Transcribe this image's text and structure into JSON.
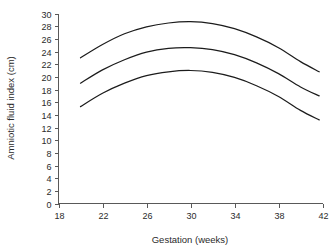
{
  "chart_data": {
    "type": "line",
    "title": "",
    "xlabel": "Gestation (weeks)",
    "ylabel": "Amniotic fluid index (cm)",
    "xlim": [
      18,
      42
    ],
    "ylim": [
      0,
      30
    ],
    "xticks": [
      18,
      22,
      26,
      30,
      34,
      38,
      42
    ],
    "yticks": [
      0,
      2,
      4,
      6,
      8,
      10,
      12,
      14,
      16,
      18,
      20,
      22,
      24,
      26,
      28,
      30
    ],
    "grid": false,
    "legend": "none",
    "x": [
      20,
      22,
      24,
      26,
      28,
      30,
      32,
      34,
      36,
      38,
      40,
      41.7
    ],
    "series": [
      {
        "name": "upper",
        "values": [
          23.0,
          25.1,
          26.8,
          27.9,
          28.5,
          28.7,
          28.4,
          27.6,
          26.3,
          24.6,
          22.4,
          20.8
        ]
      },
      {
        "name": "middle",
        "values": [
          19.0,
          21.1,
          22.7,
          23.9,
          24.5,
          24.6,
          24.3,
          23.5,
          22.2,
          20.5,
          18.4,
          17.0
        ]
      },
      {
        "name": "lower",
        "values": [
          15.3,
          17.4,
          19.0,
          20.2,
          20.8,
          21.0,
          20.7,
          19.9,
          18.6,
          16.9,
          14.7,
          13.2
        ]
      }
    ],
    "colors": {
      "curve": "#1c1c1c",
      "axis": "#595959",
      "text": "#2b2b2b",
      "background": "#ffffff"
    }
  }
}
